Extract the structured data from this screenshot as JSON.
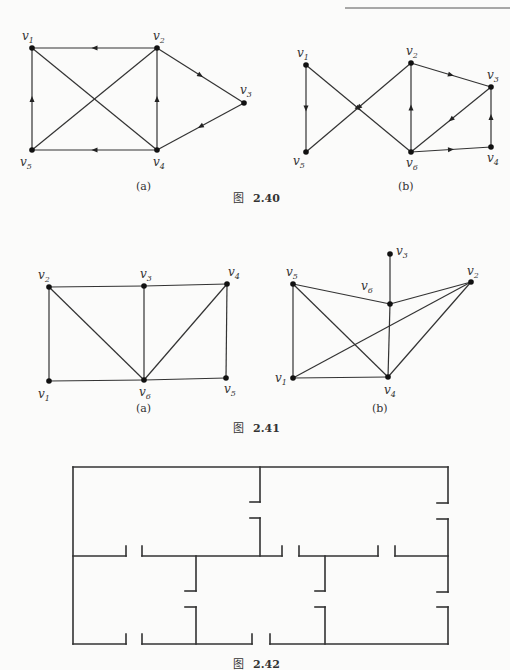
{
  "header_rule": {
    "x1": 345,
    "x2": 510,
    "y": 8
  },
  "figures": [
    {
      "id": "2.40",
      "caption_prefix": "图",
      "caption_number": "2.40",
      "caption_pos": [
        255,
        202
      ],
      "subfigures": [
        {
          "label": "(a)",
          "label_pos": [
            136,
            190
          ],
          "directed": true,
          "vertices": [
            {
              "name": "v",
              "sub": "1",
              "x": 32,
              "y": 48,
              "lx": 22,
              "ly": 40
            },
            {
              "name": "v",
              "sub": "2",
              "x": 157,
              "y": 48,
              "lx": 153,
              "ly": 40
            },
            {
              "name": "v",
              "sub": "3",
              "x": 244,
              "y": 103,
              "lx": 240,
              "ly": 94
            },
            {
              "name": "v",
              "sub": "4",
              "x": 157,
              "y": 150,
              "lx": 153,
              "ly": 166
            },
            {
              "name": "v",
              "sub": "5",
              "x": 32,
              "y": 150,
              "lx": 20,
              "ly": 166
            }
          ],
          "edges": [
            {
              "from": 1,
              "to": 0,
              "arrow": true
            },
            {
              "from": 0,
              "to": 3,
              "arrow": false
            },
            {
              "from": 1,
              "to": 4,
              "arrow": false
            },
            {
              "from": 3,
              "to": 1,
              "arrow": true
            },
            {
              "from": 1,
              "to": 2,
              "arrow": true
            },
            {
              "from": 2,
              "to": 3,
              "arrow": true
            },
            {
              "from": 3,
              "to": 4,
              "arrow": true
            },
            {
              "from": 4,
              "to": 0,
              "arrow": true
            }
          ]
        },
        {
          "label": "(b)",
          "label_pos": [
            398,
            190
          ],
          "directed": true,
          "vertices": [
            {
              "name": "v",
              "sub": "1",
              "x": 306,
              "y": 65,
              "lx": 297,
              "ly": 57
            },
            {
              "name": "v",
              "sub": "2",
              "x": 411,
              "y": 63,
              "lx": 406,
              "ly": 55
            },
            {
              "name": "v",
              "sub": "3",
              "x": 491,
              "y": 87,
              "lx": 487,
              "ly": 79
            },
            {
              "name": "v",
              "sub": "4",
              "x": 491,
              "y": 147,
              "lx": 487,
              "ly": 162
            },
            {
              "name": "v",
              "sub": "5",
              "x": 306,
              "y": 152,
              "lx": 293,
              "ly": 165
            },
            {
              "name": "v",
              "sub": "6",
              "x": 411,
              "y": 152,
              "lx": 406,
              "ly": 167
            }
          ],
          "edges": [
            {
              "from": 0,
              "to": 4,
              "arrow": true
            },
            {
              "from": 0,
              "to": 5,
              "arrow": true
            },
            {
              "from": 1,
              "to": 4,
              "arrow": true
            },
            {
              "from": 5,
              "to": 1,
              "arrow": true
            },
            {
              "from": 1,
              "to": 2,
              "arrow": true
            },
            {
              "from": 2,
              "to": 5,
              "arrow": true
            },
            {
              "from": 5,
              "to": 3,
              "arrow": true
            },
            {
              "from": 3,
              "to": 2,
              "arrow": true
            }
          ]
        }
      ]
    },
    {
      "id": "2.41",
      "caption_prefix": "图",
      "caption_number": "2.41",
      "caption_pos": [
        255,
        432
      ],
      "subfigures": [
        {
          "label": "(a)",
          "label_pos": [
            136,
            412
          ],
          "directed": false,
          "vertices": [
            {
              "name": "v",
              "sub": "2",
              "x": 49,
              "y": 287,
              "lx": 38,
              "ly": 279
            },
            {
              "name": "v",
              "sub": "3",
              "x": 144,
              "y": 286,
              "lx": 140,
              "ly": 278
            },
            {
              "name": "v",
              "sub": "4",
              "x": 227,
              "y": 284,
              "lx": 228,
              "ly": 276
            },
            {
              "name": "v",
              "sub": "1",
              "x": 49,
              "y": 381,
              "lx": 38,
              "ly": 398
            },
            {
              "name": "v",
              "sub": "6",
              "x": 144,
              "y": 380,
              "lx": 139,
              "ly": 396
            },
            {
              "name": "v",
              "sub": "5",
              "x": 226,
              "y": 378,
              "lx": 224,
              "ly": 393
            }
          ],
          "edges": [
            {
              "from": 0,
              "to": 1
            },
            {
              "from": 1,
              "to": 2
            },
            {
              "from": 0,
              "to": 3
            },
            {
              "from": 0,
              "to": 4
            },
            {
              "from": 1,
              "to": 4
            },
            {
              "from": 2,
              "to": 4
            },
            {
              "from": 2,
              "to": 5
            },
            {
              "from": 3,
              "to": 4
            },
            {
              "from": 4,
              "to": 5
            }
          ]
        },
        {
          "label": "(b)",
          "label_pos": [
            372,
            412
          ],
          "directed": false,
          "vertices": [
            {
              "name": "v",
              "sub": "3",
              "x": 390,
              "y": 254,
              "lx": 396,
              "ly": 255
            },
            {
              "name": "v",
              "sub": "5",
              "x": 293,
              "y": 284,
              "lx": 286,
              "ly": 276
            },
            {
              "name": "v",
              "sub": "2",
              "x": 471,
              "y": 282,
              "lx": 467,
              "ly": 275
            },
            {
              "name": "v",
              "sub": "6",
              "x": 390,
              "y": 304,
              "lx": 361,
              "ly": 290
            },
            {
              "name": "v",
              "sub": "1",
              "x": 293,
              "y": 378,
              "lx": 275,
              "ly": 382
            },
            {
              "name": "v",
              "sub": "4",
              "x": 388,
              "y": 377,
              "lx": 384,
              "ly": 394
            }
          ],
          "edges": [
            {
              "from": 0,
              "to": 3
            },
            {
              "from": 1,
              "to": 3
            },
            {
              "from": 3,
              "to": 2
            },
            {
              "from": 3,
              "to": 5
            },
            {
              "from": 1,
              "to": 4
            },
            {
              "from": 1,
              "to": 5
            },
            {
              "from": 4,
              "to": 2
            },
            {
              "from": 4,
              "to": 5
            },
            {
              "from": 5,
              "to": 2
            }
          ]
        }
      ]
    },
    {
      "id": "2.42",
      "caption_prefix": "图",
      "caption_number": "2.42",
      "caption_pos": [
        255,
        668
      ],
      "floor_plan_walls": [
        [
          [
            73,
            467
          ],
          [
            448,
            467
          ]
        ],
        [
          [
            73,
            467
          ],
          [
            73,
            644
          ]
        ],
        [
          [
            448,
            467
          ],
          [
            448,
            503
          ]
        ],
        [
          [
            437,
            503
          ],
          [
            448,
            503
          ]
        ],
        [
          [
            437,
            519
          ],
          [
            448,
            519
          ]
        ],
        [
          [
            448,
            519
          ],
          [
            448,
            592
          ]
        ],
        [
          [
            437,
            592
          ],
          [
            448,
            592
          ]
        ],
        [
          [
            437,
            607
          ],
          [
            448,
            607
          ]
        ],
        [
          [
            448,
            607
          ],
          [
            448,
            644
          ]
        ],
        [
          [
            260,
            467
          ],
          [
            260,
            502
          ]
        ],
        [
          [
            250,
            502
          ],
          [
            260,
            502
          ]
        ],
        [
          [
            250,
            518
          ],
          [
            260,
            518
          ]
        ],
        [
          [
            260,
            518
          ],
          [
            260,
            556
          ]
        ],
        [
          [
            73,
            556
          ],
          [
            126,
            556
          ]
        ],
        [
          [
            126,
            546
          ],
          [
            126,
            556
          ]
        ],
        [
          [
            142,
            546
          ],
          [
            142,
            556
          ]
        ],
        [
          [
            142,
            556
          ],
          [
            282,
            556
          ]
        ],
        [
          [
            282,
            546
          ],
          [
            282,
            556
          ]
        ],
        [
          [
            299,
            546
          ],
          [
            299,
            556
          ]
        ],
        [
          [
            299,
            556
          ],
          [
            378,
            556
          ]
        ],
        [
          [
            378,
            546
          ],
          [
            378,
            556
          ]
        ],
        [
          [
            395,
            546
          ],
          [
            395,
            556
          ]
        ],
        [
          [
            395,
            556
          ],
          [
            448,
            556
          ]
        ],
        [
          [
            196,
            556
          ],
          [
            196,
            591
          ]
        ],
        [
          [
            185,
            591
          ],
          [
            196,
            591
          ]
        ],
        [
          [
            185,
            607
          ],
          [
            196,
            607
          ]
        ],
        [
          [
            196,
            607
          ],
          [
            196,
            644
          ]
        ],
        [
          [
            325,
            556
          ],
          [
            325,
            591
          ]
        ],
        [
          [
            315,
            591
          ],
          [
            325,
            591
          ]
        ],
        [
          [
            315,
            607
          ],
          [
            325,
            607
          ]
        ],
        [
          [
            325,
            607
          ],
          [
            325,
            644
          ]
        ],
        [
          [
            73,
            644
          ],
          [
            126,
            644
          ]
        ],
        [
          [
            126,
            634
          ],
          [
            126,
            644
          ]
        ],
        [
          [
            142,
            634
          ],
          [
            142,
            644
          ]
        ],
        [
          [
            142,
            644
          ],
          [
            252,
            644
          ]
        ],
        [
          [
            252,
            634
          ],
          [
            252,
            644
          ]
        ],
        [
          [
            270,
            634
          ],
          [
            270,
            644
          ]
        ],
        [
          [
            270,
            644
          ],
          [
            448,
            644
          ]
        ]
      ]
    }
  ]
}
